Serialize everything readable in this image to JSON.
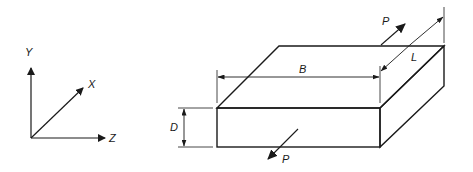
{
  "diagram": {
    "type": "isometric-block-with-dimensions",
    "colors": {
      "line": "#1a1a1a",
      "background": "#ffffff"
    },
    "axes": {
      "labels": {
        "y": "Y",
        "x": "X",
        "z": "Z"
      }
    },
    "block": {
      "dimensions": {
        "width": "B",
        "length": "L",
        "depth": "D"
      }
    },
    "loads": [
      {
        "label": "P",
        "position": "back",
        "direction": "away"
      },
      {
        "label": "P",
        "position": "front",
        "direction": "toward"
      }
    ]
  }
}
